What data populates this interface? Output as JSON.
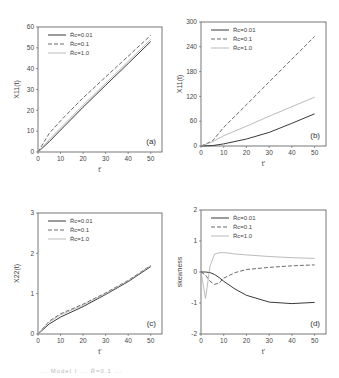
{
  "figure": {
    "caption_fragment": "... Model I ... R̄=0.1 ..."
  },
  "legend_labels": [
    "R̄c=0.01",
    "R̄c=0.1",
    "R̄c=1.0"
  ],
  "chart_data": [
    {
      "type": "line",
      "panel": "(a)",
      "title": "",
      "xlabel": "t'",
      "ylabel": "X11(t)",
      "xlim": [
        0,
        55
      ],
      "ylim": [
        0,
        60
      ],
      "xticks": [
        0,
        10,
        20,
        30,
        40,
        50
      ],
      "yticks": [
        0,
        10,
        20,
        30,
        40,
        50,
        60
      ],
      "grid": false,
      "legend_position": "upper left",
      "x": [
        0,
        5,
        10,
        20,
        30,
        40,
        50
      ],
      "series": [
        {
          "name": "R̄c=0.01",
          "style": "solid",
          "values": [
            0,
            5,
            10.5,
            21.5,
            32,
            42.5,
            53
          ]
        },
        {
          "name": "R̄c=0.1",
          "style": "dashed",
          "values": [
            0,
            9,
            15,
            26,
            36,
            46,
            56
          ]
        },
        {
          "name": "R̄c=1.0",
          "style": "dotted-light",
          "values": [
            0,
            6,
            11.5,
            22.5,
            33,
            43.5,
            54
          ]
        }
      ]
    },
    {
      "type": "line",
      "panel": "(b)",
      "title": "",
      "xlabel": "t'",
      "ylabel": "X11(t)",
      "xlim": [
        0,
        55
      ],
      "ylim": [
        0,
        300
      ],
      "xticks": [
        0,
        10,
        20,
        30,
        40,
        50
      ],
      "yticks": [
        0,
        60,
        120,
        180,
        240,
        300
      ],
      "grid": false,
      "legend_position": "upper left",
      "x": [
        0,
        5,
        10,
        20,
        30,
        40,
        50
      ],
      "series": [
        {
          "name": "R̄c=0.01",
          "style": "solid",
          "values": [
            0,
            1,
            5,
            17,
            33,
            55,
            78
          ]
        },
        {
          "name": "R̄c=0.1",
          "style": "dashed",
          "values": [
            0,
            12,
            45,
            100,
            155,
            210,
            265
          ]
        },
        {
          "name": "R̄c=1.0",
          "style": "dotted-light",
          "values": [
            0,
            10,
            25,
            48,
            72,
            95,
            118
          ]
        }
      ]
    },
    {
      "type": "line",
      "panel": "(c)",
      "title": "",
      "xlabel": "t'",
      "ylabel": "X22(t)",
      "xlim": [
        0,
        55
      ],
      "ylim": [
        0,
        3
      ],
      "xticks": [
        0,
        10,
        20,
        30,
        40,
        50
      ],
      "yticks": [
        0,
        1,
        2,
        3
      ],
      "grid": false,
      "legend_position": "upper left",
      "x": [
        0,
        5,
        10,
        20,
        30,
        40,
        50
      ],
      "series": [
        {
          "name": "R̄c=0.01",
          "style": "solid",
          "values": [
            0,
            0.25,
            0.42,
            0.68,
            0.98,
            1.3,
            1.67
          ]
        },
        {
          "name": "R̄c=0.1",
          "style": "dashed",
          "values": [
            0,
            0.32,
            0.5,
            0.74,
            1.02,
            1.33,
            1.7
          ]
        },
        {
          "name": "R̄c=1.0",
          "style": "dotted-light",
          "values": [
            0,
            0.3,
            0.47,
            0.72,
            1.0,
            1.32,
            1.69
          ]
        }
      ]
    },
    {
      "type": "line",
      "panel": "(d)",
      "title": "",
      "xlabel": "t'",
      "ylabel": "skewness",
      "xlim": [
        0,
        55
      ],
      "ylim": [
        -2,
        2
      ],
      "xticks": [
        0,
        10,
        20,
        30,
        40,
        50
      ],
      "yticks": [
        -2,
        -1,
        0,
        1,
        2
      ],
      "grid": false,
      "legend_position": "upper left",
      "x": [
        0,
        2,
        4,
        6,
        8,
        10,
        15,
        20,
        30,
        40,
        50
      ],
      "series": [
        {
          "name": "R̄c=0.01",
          "style": "solid",
          "values": [
            0,
            0,
            -0.02,
            -0.08,
            -0.18,
            -0.3,
            -0.55,
            -0.75,
            -0.97,
            -1.02,
            -0.98
          ]
        },
        {
          "name": "R̄c=0.1",
          "style": "dashed",
          "values": [
            0,
            -0.1,
            -0.3,
            -0.4,
            -0.35,
            -0.2,
            -0.02,
            0.08,
            0.15,
            0.2,
            0.23
          ]
        },
        {
          "name": "R̄c=1.0",
          "style": "dotted-light",
          "values": [
            0,
            -0.85,
            0.2,
            0.58,
            0.62,
            0.63,
            0.58,
            0.55,
            0.5,
            0.46,
            0.44
          ]
        }
      ]
    }
  ]
}
